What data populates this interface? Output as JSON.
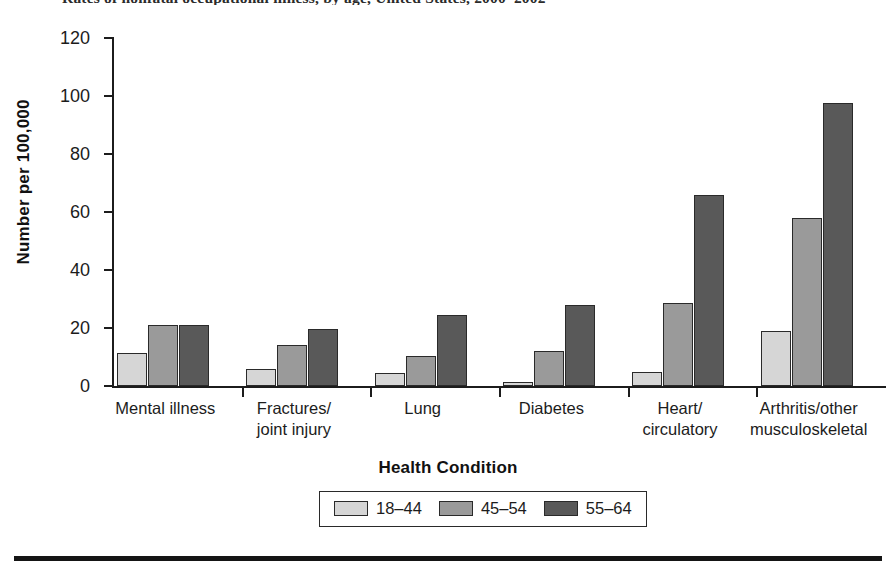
{
  "chart_data": {
    "type": "bar",
    "title": "Rates of nonfatal occupational illness, by age, United States, 2000–2002",
    "xlabel": "Health Condition",
    "ylabel": "Number per 100,000",
    "ylim": [
      0,
      120
    ],
    "yticks": [
      0,
      20,
      40,
      60,
      80,
      100,
      120
    ],
    "grid": false,
    "legend_position": "bottom-center",
    "categories": [
      "Mental illness",
      "Fractures/\njoint injury",
      "Lung",
      "Diabetes",
      "Heart/\ncirculatory",
      "Arthritis/other\nmusculoskeletal"
    ],
    "category_lines": [
      [
        "Mental illness"
      ],
      [
        "Fractures/",
        "joint injury"
      ],
      [
        "Lung"
      ],
      [
        "Diabetes"
      ],
      [
        "Heart/",
        "circulatory"
      ],
      [
        "Arthritis/other",
        "musculoskeletal"
      ]
    ],
    "series": [
      {
        "name": "18–44",
        "color": "#d6d6d6",
        "values": [
          11.5,
          6.0,
          4.5,
          1.5,
          4.7,
          19.0
        ]
      },
      {
        "name": "45–54",
        "color": "#9a9a9a",
        "values": [
          21.0,
          14.0,
          10.5,
          12.0,
          28.5,
          58.0
        ]
      },
      {
        "name": "55–64",
        "color": "#595959",
        "values": [
          21.0,
          19.5,
          24.5,
          28.0,
          66.0,
          97.5
        ]
      }
    ]
  },
  "legend": {
    "items": [
      {
        "label": "18–44",
        "color": "#d6d6d6"
      },
      {
        "label": "45–54",
        "color": "#9a9a9a"
      },
      {
        "label": "55–64",
        "color": "#595959"
      }
    ]
  },
  "axes": {
    "y_title": "Number per 100,000",
    "x_title": "Health Condition",
    "y_tick_labels": [
      "120",
      "100",
      "80",
      "60",
      "40",
      "20",
      "0"
    ]
  }
}
